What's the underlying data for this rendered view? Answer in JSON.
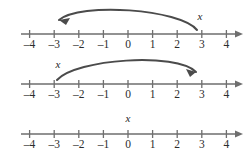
{
  "figure": {
    "axis_color": "#6e6e6e",
    "arc_color": "#4b4b4b",
    "label_color": "#2c2c2c",
    "background": "#ffffff",
    "tick_values": [
      -4,
      -3,
      -2,
      -1,
      0,
      1,
      2,
      3,
      4
    ],
    "tick_labels": [
      "–4",
      "–3",
      "–2",
      "–1",
      "0",
      "1",
      "2",
      "3",
      "4"
    ],
    "variable_symbol": "x"
  },
  "chart_data": {
    "type": "line",
    "xlabel": "",
    "ylabel": "",
    "xlim": [
      -4,
      4
    ],
    "grid": false,
    "categories": [
      "–4",
      "–3",
      "–2",
      "–1",
      "0",
      "1",
      "2",
      "3",
      "4"
    ],
    "x": [
      -4,
      -3,
      -2,
      -1,
      0,
      1,
      2,
      3,
      4
    ],
    "series": [
      {
        "name": "Number line 1",
        "variable_label": "x",
        "variable_position": 3,
        "arc": {
          "from": 3,
          "to": -3,
          "direction": "left",
          "arrowhead_at": -3
        }
      },
      {
        "name": "Number line 2",
        "variable_label": "x",
        "variable_position": -3,
        "arc": {
          "from": -3,
          "to": 3,
          "direction": "right",
          "arrowhead_at": 3
        }
      },
      {
        "name": "Number line 3",
        "variable_label": "x",
        "variable_position": 0,
        "arc": null
      }
    ]
  },
  "lines": [
    {
      "name": "number-line-1",
      "axis_y": 34,
      "label_y": 48,
      "variable_label": "x",
      "variable_x": 200,
      "variable_y": 20,
      "arc": {
        "path": "M 197 30 C 180 9, 80 2, 59 20",
        "head": "M 59 20 L 70 18 L 66 25 Z"
      }
    },
    {
      "name": "number-line-2",
      "axis_y": 84,
      "label_y": 98,
      "variable_label": "x",
      "variable_x": 58,
      "variable_y": 68,
      "arc": {
        "path": "M 57 80 C 76 59, 176 52, 196 72",
        "head": "M 196 72 L 186 69 L 190 77 Z"
      }
    },
    {
      "name": "number-line-3",
      "axis_y": 134,
      "label_y": 148,
      "variable_label": "x",
      "variable_x": 128,
      "variable_y": 122,
      "arc": null
    }
  ],
  "geometry": {
    "axis_start_x": 21,
    "axis_end_x": 243,
    "tick_origin_x": 128,
    "tick_spacing": 24.6,
    "tick_half_height": 4
  }
}
